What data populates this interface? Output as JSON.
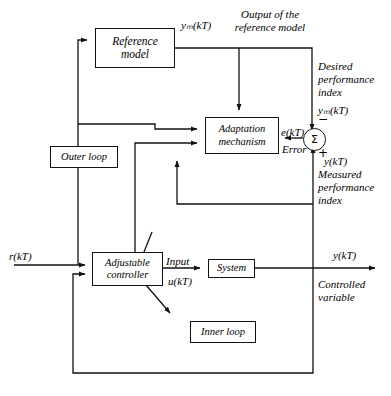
{
  "diagram": {
    "blocks": {
      "reference_model": "Reference\nmodel",
      "adaptation_mechanism": "Adaptation\nmechanism",
      "outer_loop": "Outer loop",
      "inner_loop": "Inner loop",
      "adjustable_controller": "Adjustable\ncontroller",
      "system": "System"
    },
    "summing_junction": {
      "symbol": "Σ",
      "minus_sign": "−",
      "plus_sign": "+"
    },
    "signals": {
      "reference_input": "r(kT)",
      "model_output": "yₘ(kT)",
      "model_output_note": "Output of the\nreference model",
      "desired_index": "Desired\nperformance\nindex",
      "desired_index_signal": "yₘ(kT)",
      "error": "e(kT)",
      "error_note": "Error",
      "measured_index_signal": "y(kT)",
      "measured_index": "Measured\nperformance\nindex",
      "control_input_label": "Input",
      "control_input_signal": "u(kT)",
      "plant_output": "y(kT)",
      "controlled_variable": "Controlled\nvariable"
    },
    "colors": {
      "line": "#111111",
      "background": "#ffffff",
      "text": "#000000"
    }
  }
}
